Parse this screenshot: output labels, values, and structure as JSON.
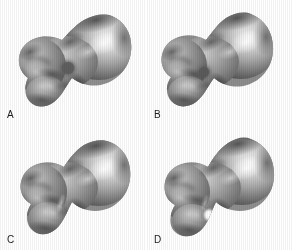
{
  "figure": {
    "background_color": "#ffffff",
    "layout": "2x2 panel grid",
    "panel_count": 4,
    "modality": "grayscale 3D surface rendering"
  },
  "panels": [
    {
      "id": "a",
      "label": "A",
      "position": "top-left",
      "marker": {
        "present": true,
        "kind": "dark-circular-region",
        "color": "#5e5e5e",
        "cx": 68,
        "cy": 68,
        "r": 7
      },
      "highlight": {
        "present": false
      }
    },
    {
      "id": "b",
      "label": "B",
      "position": "top-right",
      "marker": {
        "present": true,
        "kind": "dark-circular-region",
        "color": "#5a5a5a",
        "cx": 57,
        "cy": 72,
        "r": 6
      },
      "highlight": {
        "present": false
      }
    },
    {
      "id": "c",
      "label": "C",
      "position": "bottom-left",
      "marker": {
        "present": false
      },
      "highlight": {
        "present": false
      }
    },
    {
      "id": "d",
      "label": "D",
      "position": "bottom-right",
      "marker": {
        "present": false
      },
      "highlight": {
        "present": true,
        "kind": "bright-specular-spot",
        "color": "#fdfdfd",
        "cx": 62,
        "cy": 90,
        "r": 5
      }
    }
  ],
  "palette": {
    "background": "#ffffff",
    "label_text": "#1a1a1a",
    "surface_dark": "#3c3c3c",
    "surface_mid": "#8a8a8a",
    "surface_light": "#d5d5d5",
    "surface_highlight": "#fbfbfb",
    "edge_shadow": "#2a2a2a",
    "marker_dark": "#5e5e5e"
  }
}
